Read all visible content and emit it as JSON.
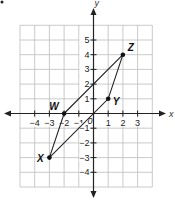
{
  "diagram": {
    "type": "coordinate-plane",
    "axes": {
      "x_label": "x",
      "y_label": "y",
      "x_ticks": [
        {
          "value": -4,
          "label": "−4"
        },
        {
          "value": -3,
          "label": "−3"
        },
        {
          "value": -2,
          "label": "−2"
        },
        {
          "value": -1,
          "label": "−1"
        },
        {
          "value": 1,
          "label": "1"
        },
        {
          "value": 2,
          "label": "2"
        },
        {
          "value": 3,
          "label": "3"
        }
      ],
      "y_ticks": [
        {
          "value": 5,
          "label": "5"
        },
        {
          "value": 4,
          "label": "4"
        },
        {
          "value": 3,
          "label": "3"
        },
        {
          "value": 2,
          "label": "2"
        },
        {
          "value": 1,
          "label": "1"
        },
        {
          "value": -1,
          "label": "−1"
        },
        {
          "value": -2,
          "label": "−2"
        },
        {
          "value": -3,
          "label": "−3"
        },
        {
          "value": -4,
          "label": "−4"
        }
      ],
      "origin_label": "0",
      "grid": {
        "x_min": -5,
        "x_max": 4,
        "y_min": -5,
        "y_max": 6
      }
    },
    "points": [
      {
        "name": "W",
        "x": -2,
        "y": 0
      },
      {
        "name": "X",
        "x": -3,
        "y": -3
      },
      {
        "name": "Y",
        "x": 1,
        "y": 1
      },
      {
        "name": "Z",
        "x": 2,
        "y": 4
      }
    ],
    "polygon": [
      "W",
      "Z",
      "Y",
      "X"
    ],
    "colors": {
      "grid": "#bdbdbd",
      "axis": "#222222",
      "shape": "#222222",
      "point": "#111111"
    }
  }
}
